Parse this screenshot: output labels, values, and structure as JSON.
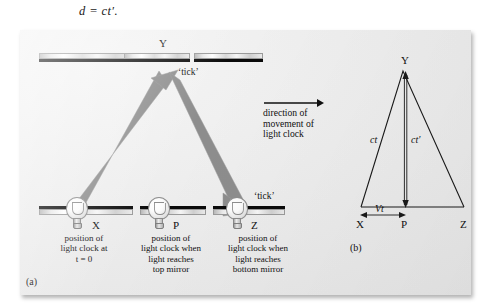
{
  "equation": "d = ct′.",
  "colors": {
    "beam": "#8d8d8d",
    "beam_edge": "#bdbdbd",
    "plate_bg": "#ededed",
    "ink": "#101010",
    "mirror_black": "#0a0a0a"
  },
  "panel_a": {
    "label": "(a)",
    "top_mirrors": [
      {
        "name": "top-mirror-left"
      },
      {
        "name": "top-mirror-center"
      },
      {
        "name": "top-mirror-right"
      }
    ],
    "bottom_mirrors": [
      {
        "name": "bottom-mirror-left"
      },
      {
        "name": "bottom-mirror-center"
      },
      {
        "name": "bottom-mirror-right"
      }
    ],
    "points": {
      "top_center": "Y",
      "bottom_left": "X",
      "bottom_center": "P",
      "bottom_right": "Z"
    },
    "ticks": [
      {
        "name": "tick-top",
        "text": "‘tick’"
      },
      {
        "name": "tick-bottom",
        "text": "‘tick’"
      }
    ],
    "captions": [
      {
        "name": "caption-x",
        "text": "position of\nlight clock at\nt = 0"
      },
      {
        "name": "caption-p",
        "text": "position of\nlight clock when\nlight reaches\ntop mirror"
      },
      {
        "name": "caption-z",
        "text": "position of\nlight clock when\nlight reaches\nbottom mirror"
      }
    ]
  },
  "direction_note": {
    "text": "direction of\nmovement of\nlight clock",
    "arrow": "right-arrow-icon"
  },
  "panel_b": {
    "label": "(b)",
    "vertices": {
      "apex": "Y",
      "left": "X",
      "mid": "P",
      "right": "Z"
    },
    "measures": [
      {
        "name": "hypotenuse-label",
        "text": "ct"
      },
      {
        "name": "vertical-label",
        "text": "ct′"
      },
      {
        "name": "base-offset-label",
        "text": "Vt"
      }
    ]
  }
}
